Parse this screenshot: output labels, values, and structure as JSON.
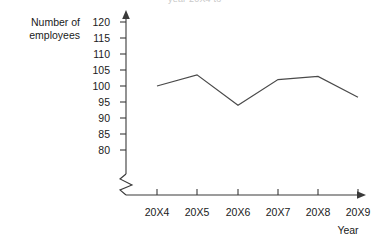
{
  "chart_data": {
    "type": "line",
    "title": "",
    "title_remnant": "year 20X4 to",
    "xlabel": "Year",
    "ylabel": "Number of employees",
    "categories": [
      "20X4",
      "20X5",
      "20X6",
      "20X7",
      "20X8",
      "20X9"
    ],
    "values": [
      100,
      103.5,
      94,
      102,
      103,
      96.5
    ],
    "series": [
      {
        "name": "Number of employees",
        "values": [
          100,
          103.5,
          94,
          102,
          103,
          96.5
        ]
      }
    ],
    "ylim": [
      80,
      120
    ],
    "y_ticks": [
      120,
      115,
      110,
      105,
      100,
      95,
      90,
      85,
      80
    ],
    "y_tick_labels": [
      "120",
      "115",
      "110",
      "105",
      "100",
      "95",
      "90",
      "85",
      "80"
    ],
    "x_tick_labels": [
      "20X4",
      "20X5",
      "20X6",
      "20X7",
      "20X8",
      "20X9"
    ],
    "grid": false,
    "legend": "none",
    "axis_break": true,
    "axis_break_note": "zigzag break on y-axis below 80",
    "line_color": "#4a4a4a",
    "axis_color": "#3a3a3a"
  },
  "axis_captions": {
    "y_line1": "Number of",
    "y_line2": "employees",
    "x": "Year"
  }
}
